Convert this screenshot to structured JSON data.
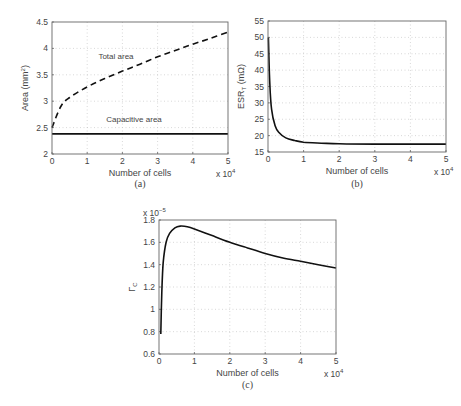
{
  "chart_data": [
    {
      "id": "a",
      "type": "line",
      "caption": "(a)",
      "title": "",
      "xlabel": "Number of cells",
      "xscale_note": "x 10^4",
      "ylabel": "Area (mm^2)",
      "xlim": [
        0,
        5
      ],
      "ylim": [
        2,
        4.5
      ],
      "xticks": [
        "0",
        "1",
        "2",
        "3",
        "4",
        "5"
      ],
      "yticks": [
        "2",
        "2.5",
        "3",
        "3.5",
        "4",
        "4.5"
      ],
      "grid": true,
      "annotations": [
        "Total area",
        "Capacitive area"
      ],
      "x": [
        0,
        0.25,
        0.5,
        1,
        1.5,
        2,
        2.5,
        3,
        3.5,
        4,
        4.5,
        5
      ],
      "series": [
        {
          "name": "Total area",
          "style": "dashed",
          "values": [
            2.5,
            2.9,
            3.07,
            3.27,
            3.43,
            3.57,
            3.7,
            3.84,
            3.96,
            4.08,
            4.19,
            4.31
          ]
        },
        {
          "name": "Capacitive area",
          "style": "solid",
          "values": [
            2.38,
            2.38,
            2.38,
            2.38,
            2.38,
            2.38,
            2.38,
            2.38,
            2.38,
            2.38,
            2.38,
            2.38
          ]
        }
      ]
    },
    {
      "id": "b",
      "type": "line",
      "caption": "(b)",
      "title": "",
      "xlabel": "Number of cells",
      "xscale_note": "x 10^4",
      "ylabel": "ESR_T (mΩ)",
      "xlim": [
        0,
        5
      ],
      "ylim": [
        15,
        55
      ],
      "xticks": [
        "0",
        "1",
        "2",
        "3",
        "4",
        "5"
      ],
      "yticks": [
        "15",
        "20",
        "25",
        "30",
        "35",
        "40",
        "45",
        "50",
        "55"
      ],
      "grid": true,
      "x": [
        0.01,
        0.05,
        0.1,
        0.2,
        0.3,
        0.5,
        0.75,
        1,
        1.5,
        2,
        3,
        4,
        5
      ],
      "series": [
        {
          "name": "ESR_T",
          "style": "solid",
          "values": [
            50,
            36,
            28,
            23,
            21,
            19.3,
            18.5,
            18,
            17.7,
            17.5,
            17.4,
            17.4,
            17.4
          ]
        }
      ]
    },
    {
      "id": "c",
      "type": "line",
      "caption": "(c)",
      "title": "",
      "xlabel": "Number of cells",
      "xscale_note": "x 10^4",
      "yscale_note": "x 10^-5",
      "ylabel": "Γ_C",
      "xlim": [
        0,
        5
      ],
      "ylim": [
        0.6,
        1.8
      ],
      "xticks": [
        "0",
        "1",
        "2",
        "3",
        "4",
        "5"
      ],
      "yticks": [
        "0.6",
        "0.8",
        "1",
        "1.2",
        "1.4",
        "1.6",
        "1.8"
      ],
      "grid": true,
      "x": [
        0.05,
        0.08,
        0.12,
        0.2,
        0.3,
        0.45,
        0.6,
        0.8,
        1,
        1.5,
        2,
        2.5,
        3,
        3.5,
        4,
        4.5,
        5
      ],
      "series": [
        {
          "name": "Γ_C",
          "style": "solid",
          "values": [
            0.78,
            1.15,
            1.42,
            1.6,
            1.68,
            1.73,
            1.745,
            1.74,
            1.72,
            1.66,
            1.6,
            1.55,
            1.5,
            1.46,
            1.43,
            1.4,
            1.37
          ]
        }
      ]
    }
  ]
}
